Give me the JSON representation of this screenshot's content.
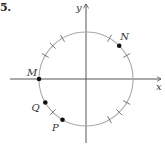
{
  "problem": {
    "number": "5."
  },
  "axes": {
    "x_label": "x",
    "y_label": "y"
  },
  "circle": {
    "center": [
      86,
      79
    ],
    "radius": 47,
    "stroke": "#aaaaaa"
  },
  "tick_angles_deg": [
    30,
    60,
    120,
    135,
    150,
    225,
    300,
    315,
    330
  ],
  "points": [
    {
      "label": "N",
      "angle_deg": 45
    },
    {
      "label": "M",
      "angle_deg": 180
    },
    {
      "label": "Q",
      "angle_deg": 210
    },
    {
      "label": "P",
      "angle_deg": 240
    }
  ],
  "colors": {
    "axis": "#444444",
    "point": "#111111",
    "tick": "#555555"
  }
}
